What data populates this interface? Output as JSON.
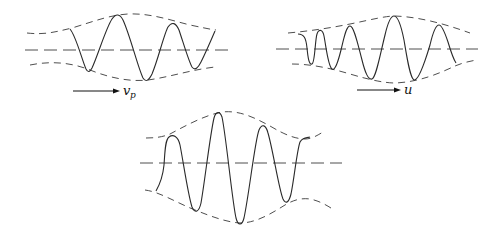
{
  "figure": {
    "panels": [
      {
        "id": "packet-phase-velocity",
        "position": "top-left",
        "arrow_label": "v",
        "arrow_label_subscript": "p"
      },
      {
        "id": "packet-group-velocity",
        "position": "top-right",
        "arrow_label": "u",
        "arrow_label_subscript": ""
      },
      {
        "id": "packet-combined",
        "position": "bottom-center"
      }
    ],
    "colors": {
      "line": "#2a2a2a",
      "background": "#ffffff"
    }
  }
}
